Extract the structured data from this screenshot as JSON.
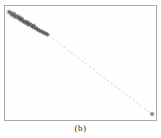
{
  "figure": {
    "caption": "(b)",
    "background_color": "#ffffff",
    "frame_color": "#aaaaaa"
  },
  "chart_data": {
    "type": "scatter",
    "title": "",
    "xlabel": "",
    "ylabel": "",
    "xlim": [
      0,
      1
    ],
    "ylim": [
      0,
      1
    ],
    "grid": "off",
    "ticks": "none",
    "legend_position": "none",
    "marker_style": "asterisk",
    "marker_color": "#5a5a5a",
    "outlier_color": "#606060",
    "line_color": "#c8c8c8",
    "line_style": "dashed",
    "series": [
      {
        "name": "cluster",
        "points": [
          [
            0.026,
            0.948
          ],
          [
            0.039,
            0.94
          ],
          [
            0.046,
            0.922
          ],
          [
            0.059,
            0.931
          ],
          [
            0.065,
            0.905
          ],
          [
            0.072,
            0.914
          ],
          [
            0.085,
            0.897
          ],
          [
            0.092,
            0.905
          ],
          [
            0.098,
            0.888
          ],
          [
            0.105,
            0.879
          ],
          [
            0.111,
            0.888
          ],
          [
            0.118,
            0.871
          ],
          [
            0.124,
            0.862
          ],
          [
            0.137,
            0.853
          ],
          [
            0.144,
            0.862
          ],
          [
            0.15,
            0.845
          ],
          [
            0.157,
            0.836
          ],
          [
            0.163,
            0.845
          ],
          [
            0.176,
            0.828
          ],
          [
            0.183,
            0.819
          ],
          [
            0.19,
            0.828
          ],
          [
            0.196,
            0.81
          ],
          [
            0.209,
            0.802
          ],
          [
            0.216,
            0.793
          ],
          [
            0.229,
            0.784
          ],
          [
            0.242,
            0.776
          ],
          [
            0.255,
            0.767
          ],
          [
            0.268,
            0.759
          ],
          [
            0.281,
            0.75
          ]
        ]
      },
      {
        "name": "outlier",
        "points": [
          [
            0.974,
            0.052
          ]
        ]
      }
    ],
    "reference_line": {
      "from": [
        0.29,
        0.741
      ],
      "to": [
        0.965,
        0.06
      ]
    }
  }
}
